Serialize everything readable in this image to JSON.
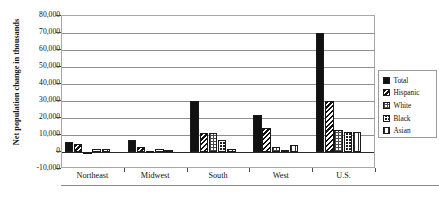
{
  "chart_data": {
    "type": "bar",
    "title": "",
    "xlabel": "",
    "ylabel": "Net population change in thousands",
    "ylim": [
      -10000,
      80000
    ],
    "ytick_step": 10000,
    "grid": true,
    "legend_position": "right",
    "categories": [
      "Northeast",
      "Midwest",
      "South",
      "West",
      "U.S."
    ],
    "ytick_labels": [
      "80,000",
      "70,000",
      "60,000",
      "50,000",
      "40,000",
      "30,000",
      "20,000",
      "10,000",
      "0",
      "-10,000"
    ],
    "series": [
      {
        "name": "Total",
        "pattern": "solid-black",
        "values": [
          6000,
          7000,
          30000,
          22000,
          70000
        ]
      },
      {
        "name": "Hispanic",
        "pattern": "diagonal-stripes",
        "values": [
          5000,
          3000,
          11000,
          14000,
          30000
        ]
      },
      {
        "name": "White",
        "pattern": "light-checker",
        "values": [
          -1200,
          400,
          11000,
          3000,
          13000
        ]
      },
      {
        "name": "Black",
        "pattern": "dark-dots",
        "values": [
          1500,
          1500,
          7000,
          1000,
          12000
        ]
      },
      {
        "name": "Asian",
        "pattern": "vertical-dots",
        "values": [
          2000,
          1000,
          2000,
          4000,
          12000
        ]
      }
    ]
  },
  "legend": {
    "items": [
      {
        "label": "Total"
      },
      {
        "label": "Hispanic"
      },
      {
        "label": "White"
      },
      {
        "label": "Black"
      },
      {
        "label": "Asian"
      }
    ]
  },
  "colors": {
    "axis": "#2b2b2b",
    "grid": "#8f8f8f",
    "series_total": "#111111",
    "frame": "#a8a8a8"
  }
}
